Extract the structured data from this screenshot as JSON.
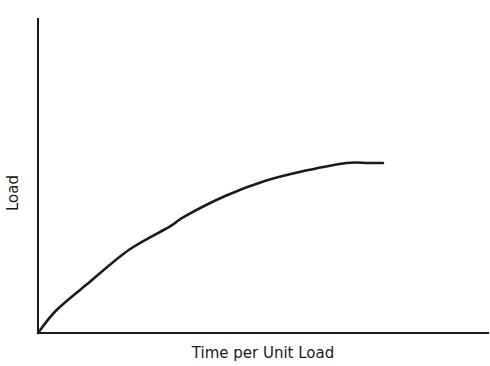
{
  "chart_data": {
    "type": "line",
    "title": "",
    "xlabel": "Time per Unit Load",
    "ylabel": "Load",
    "grid": false,
    "legend": null,
    "ticks": {
      "x": [],
      "y": []
    },
    "xlim": [
      0,
      1
    ],
    "ylim": [
      0,
      1
    ],
    "series": [
      {
        "name": "Load vs Time per Unit Load",
        "description": "Concave increasing curve starting at origin and leveling off (plateau) around 53% of x-range",
        "x": [
          0.0,
          0.05,
          0.14,
          0.25,
          0.36,
          0.4,
          0.51,
          0.62,
          0.73,
          0.84,
          0.9,
          0.94
        ],
        "y": [
          0.0,
          0.09,
          0.2,
          0.33,
          0.42,
          0.46,
          0.54,
          0.6,
          0.64,
          0.67,
          0.67,
          0.67
        ]
      }
    ],
    "colors": {
      "axis": "#1a1a1a",
      "curve": "#1a1a1a",
      "background": "#ffffff"
    }
  }
}
